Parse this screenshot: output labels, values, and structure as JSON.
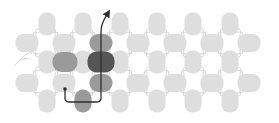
{
  "diagram": {
    "colors": {
      "background": "#ffffff",
      "light": "#dedede",
      "medium": "#9a9a9a",
      "dark": "#555555",
      "connector": "#d8d8d8",
      "path": "#2e2e2e"
    },
    "vertical_nodes": {
      "rows_y": [
        24,
        62,
        101
      ],
      "cols_x": [
        47,
        83,
        120,
        157,
        193,
        230
      ],
      "width": 17,
      "height": 23
    },
    "horizontal_nodes": {
      "rows_y": [
        43,
        83
      ],
      "cols_x": [
        27,
        64,
        101,
        138,
        175,
        212,
        249
      ],
      "width": 23,
      "height": 18
    },
    "highlighted_nodes": [
      {
        "x": 101,
        "y": 43,
        "w": 23,
        "h": 18,
        "shade": "medium"
      },
      {
        "x": 65,
        "y": 62,
        "w": 25,
        "h": 20,
        "shade": "medium"
      },
      {
        "x": 101,
        "y": 62,
        "w": 27,
        "h": 21,
        "shade": "dark"
      },
      {
        "x": 101,
        "y": 83,
        "w": 23,
        "h": 18,
        "shade": "medium"
      },
      {
        "x": 83,
        "y": 101,
        "w": 17,
        "h": 23,
        "shade": "medium"
      }
    ],
    "path": {
      "start": {
        "x": 65,
        "y": 89
      },
      "corner1": {
        "x": 65,
        "y": 102
      },
      "corner2": {
        "x": 101,
        "y": 102
      },
      "end": {
        "x": 108,
        "y": 13
      },
      "arrow": "arrowhead-up-right"
    }
  }
}
